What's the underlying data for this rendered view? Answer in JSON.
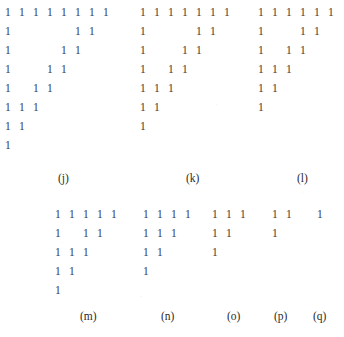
{
  "figure": {
    "kind": "tally-mark-staircase-diagram",
    "glyph": "1",
    "glyph_color": "#3a3a3a",
    "background_color": "#ffffff",
    "label_color": "#2b2b2b",
    "column_step_px": 14,
    "row_step_px": 19,
    "width_px": 344,
    "height_px": 337,
    "panels": [
      {
        "id": "j",
        "label": "(j)",
        "label_x": 58,
        "label_y": 172,
        "origin_x": 5,
        "origin_y": 6,
        "row_count": 8,
        "rows": [
          {
            "columns": [
              0,
              1,
              2,
              3,
              4,
              5,
              6,
              7
            ]
          },
          {
            "columns": [
              0,
              5,
              6
            ]
          },
          {
            "columns": [
              0,
              4,
              5
            ]
          },
          {
            "columns": [
              0,
              3,
              4
            ]
          },
          {
            "columns": [
              0,
              2,
              3
            ]
          },
          {
            "columns": [
              0,
              1,
              2
            ]
          },
          {
            "columns": [
              0,
              1
            ]
          },
          {
            "columns": [
              0
            ]
          }
        ]
      },
      {
        "id": "k",
        "label": "(k)",
        "label_x": 186,
        "label_y": 172,
        "origin_x": 140,
        "origin_y": 6,
        "row_count": 7,
        "rows": [
          {
            "columns": [
              0,
              1,
              2,
              3,
              4,
              5,
              6
            ]
          },
          {
            "columns": [
              0,
              4,
              5
            ]
          },
          {
            "columns": [
              0,
              3,
              4
            ]
          },
          {
            "columns": [
              0,
              2,
              3
            ]
          },
          {
            "columns": [
              0,
              1,
              2
            ]
          },
          {
            "columns": [
              0,
              1
            ]
          },
          {
            "columns": [
              0
            ]
          }
        ]
      },
      {
        "id": "l",
        "label": "(l)",
        "label_x": 297,
        "label_y": 172,
        "origin_x": 258,
        "origin_y": 6,
        "row_count": 6,
        "rows": [
          {
            "columns": [
              0,
              1,
              2,
              3,
              4,
              5
            ]
          },
          {
            "columns": [
              0,
              3,
              4
            ]
          },
          {
            "columns": [
              0,
              2,
              3
            ]
          },
          {
            "columns": [
              0,
              1,
              2
            ]
          },
          {
            "columns": [
              0,
              1
            ]
          },
          {
            "columns": [
              0
            ]
          }
        ]
      },
      {
        "id": "m",
        "label": "(m)",
        "label_x": 80,
        "label_y": 310,
        "origin_x": 55,
        "origin_y": 208,
        "row_count": 5,
        "rows": [
          {
            "columns": [
              0,
              1,
              2,
              3,
              4
            ]
          },
          {
            "columns": [
              0,
              2,
              3
            ]
          },
          {
            "columns": [
              0,
              1,
              2
            ]
          },
          {
            "columns": [
              0,
              1
            ]
          },
          {
            "columns": [
              0
            ]
          }
        ]
      },
      {
        "id": "n",
        "label": "(n)",
        "label_x": 161,
        "label_y": 310,
        "origin_x": 143,
        "origin_y": 208,
        "row_count": 4,
        "rows": [
          {
            "columns": [
              0,
              1,
              2,
              3
            ]
          },
          {
            "columns": [
              0,
              1,
              2
            ]
          },
          {
            "columns": [
              0,
              1
            ]
          },
          {
            "columns": [
              0
            ]
          }
        ]
      },
      {
        "id": "o",
        "label": "(o)",
        "label_x": 227,
        "label_y": 310,
        "origin_x": 212,
        "origin_y": 208,
        "row_count": 3,
        "rows": [
          {
            "columns": [
              0,
              1,
              2
            ]
          },
          {
            "columns": [
              0,
              1
            ]
          },
          {
            "columns": [
              0
            ]
          }
        ]
      },
      {
        "id": "p",
        "label": "(p)",
        "label_x": 274,
        "label_y": 310,
        "origin_x": 272,
        "origin_y": 208,
        "row_count": 2,
        "rows": [
          {
            "columns": [
              0,
              1
            ]
          },
          {
            "columns": [
              0
            ]
          }
        ]
      },
      {
        "id": "q",
        "label": "(q)",
        "label_x": 313,
        "label_y": 310,
        "origin_x": 317,
        "origin_y": 208,
        "row_count": 1,
        "rows": [
          {
            "columns": [
              0
            ]
          }
        ]
      }
    ]
  }
}
